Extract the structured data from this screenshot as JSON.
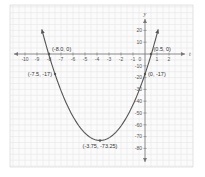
{
  "chart_data": {
    "type": "line",
    "title": "",
    "xlabel": "t",
    "ylabel": "y",
    "function": "y = 4t^2 + 30t - 17",
    "xlim": [
      -10.5,
      2.5
    ],
    "ylim": [
      -85,
      27
    ],
    "grid": true,
    "legend": null,
    "x_ticks": [
      -10,
      -9,
      -8,
      -7,
      -6,
      -5,
      -4,
      -3,
      -2,
      -1,
      0,
      1,
      2
    ],
    "x_tick_labels": [
      "-10",
      "-9",
      "-8",
      "-7",
      "-6",
      "-5",
      "-4",
      "-3",
      "-2",
      "-1",
      "0",
      "1",
      "2"
    ],
    "y_ticks": [
      20,
      10,
      -10,
      -20,
      -30,
      -40,
      -50,
      -60,
      -70,
      -80
    ],
    "y_tick_labels": [
      "20",
      "10",
      "-10",
      "-20",
      "-30",
      "-40",
      "-50",
      "-60",
      "-70",
      "-80"
    ],
    "series": [
      {
        "name": "parabola",
        "color": "#555555",
        "x": [
          -8.6,
          -8.0,
          -7.5,
          -7.0,
          -6.0,
          -5.0,
          -4.0,
          -3.75,
          -3.0,
          -2.0,
          -1.0,
          0.0,
          0.5,
          1.1
        ],
        "y": [
          20.8,
          0.0,
          -17.0,
          -31.0,
          -53.0,
          -67.0,
          -73.0,
          -73.25,
          -71.0,
          -61.0,
          -43.0,
          -17.0,
          0.0,
          20.8
        ]
      }
    ],
    "annotations": [
      {
        "label": "(-8.0, 0)",
        "x": -8.0,
        "y": 0
      },
      {
        "label": "(-7.5, -17)",
        "x": -7.5,
        "y": -17
      },
      {
        "label": "(0.5, 0)",
        "x": 0.5,
        "y": 0
      },
      {
        "label": "(0, -17)",
        "x": 0,
        "y": -17
      },
      {
        "label": "(-3.75, -73.25)",
        "x": -3.75,
        "y": -73.25
      }
    ]
  },
  "colors": {
    "grid": "#e2e2e2",
    "grid_border": "#d0d0d0",
    "axis": "#777777",
    "curve": "#555555",
    "background": "#fbfbfb"
  }
}
